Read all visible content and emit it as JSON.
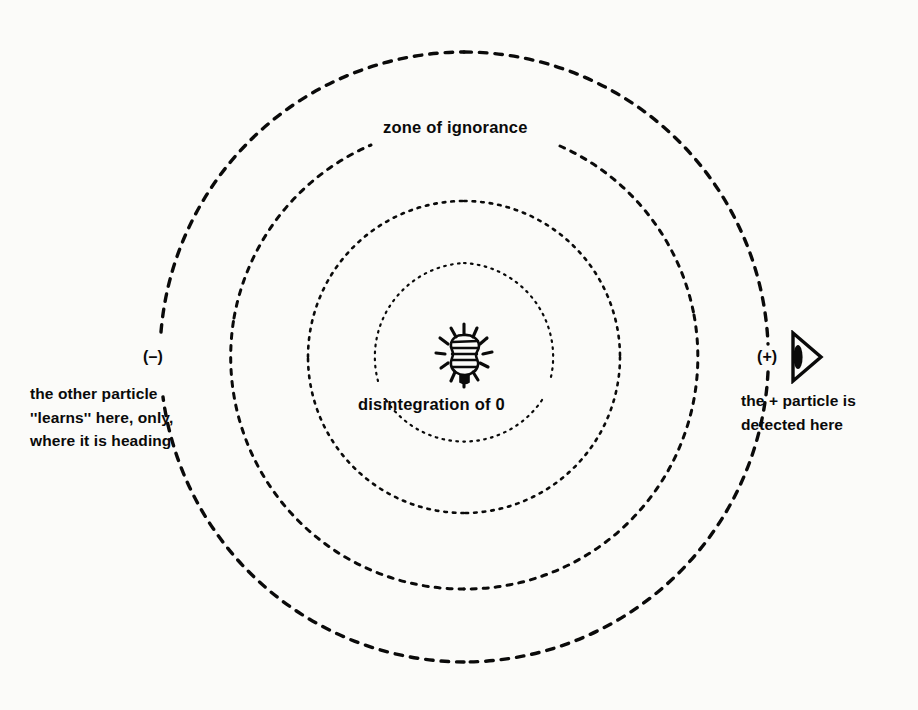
{
  "figure": {
    "title": "zone of ignorance",
    "background_color": "#fbfbf9",
    "ink_color": "#0a0a0a",
    "center": {
      "x": 464,
      "y": 357
    },
    "labels": {
      "zone": "zone of ignorance",
      "center_event": "disintegration of 0",
      "minus_sign": "(–)",
      "plus_sign": "(+)",
      "left_caption": "the other particle\n''learns'' here, only,\nwhere it is heading",
      "right_caption": "the + particle is\ndetected here"
    },
    "icons": {
      "burst": "disintegration-burst-icon",
      "detector": "detector-icon"
    },
    "rings": [
      {
        "name": "ring-inner",
        "radius": 94,
        "dash": "1.6 5.4",
        "width": 2.2,
        "gap_top_deg": 0,
        "gap_bottom_deg": 0
      },
      {
        "name": "ring-second",
        "radius": 156,
        "dash": "2.6 6.0",
        "width": 2.6,
        "gap_top_deg": 0,
        "gap_bottom_deg": 0
      },
      {
        "name": "ring-third",
        "radius": 232,
        "dash": "5.0 7.0",
        "width": 3.0,
        "gap_top_deg": 26,
        "gap_bottom_deg": 0
      },
      {
        "name": "ring-outer",
        "radius": 305,
        "dash": "7.5 8.0",
        "width": 3.4,
        "gap_top_deg": 0,
        "gap_bottom_deg": 0
      }
    ]
  }
}
